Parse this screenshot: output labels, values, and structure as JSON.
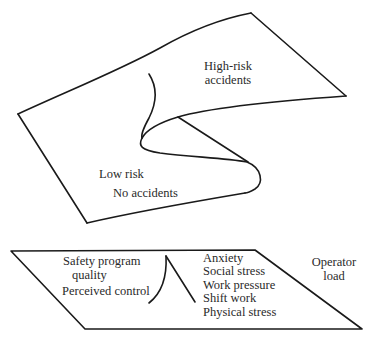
{
  "diagram": {
    "type": "cusp-catastrophe-model",
    "upper_surface": {
      "labels": {
        "high_risk_line1": "High-risk",
        "high_risk_line2": "accidents",
        "low_risk": "Low risk",
        "no_accidents": "No accidents"
      }
    },
    "control_plane": {
      "left_factors": {
        "line1": "Safety program",
        "line2": "quality",
        "line3": "Perceived control"
      },
      "right_factors": [
        "Anxiety",
        "Social stress",
        "Work pressure",
        "Shift work",
        "Physical stress"
      ],
      "axis_label": {
        "line1": "Operator",
        "line2": "load"
      }
    },
    "colors": {
      "line": "#1a1a1a",
      "text": "#2a2a2a",
      "background": "#ffffff"
    }
  }
}
